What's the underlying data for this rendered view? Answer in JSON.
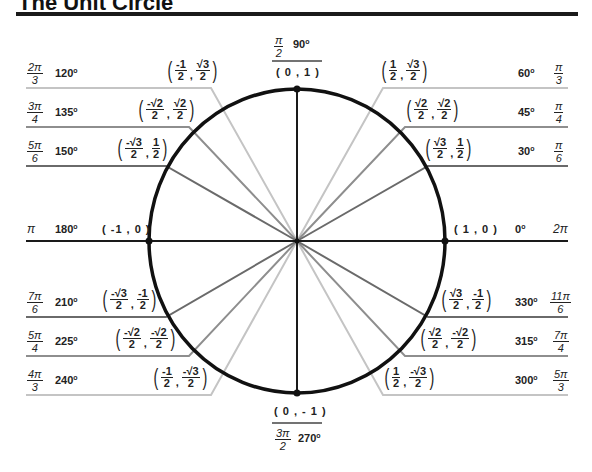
{
  "title": "The Unit Circle",
  "colors": {
    "circle": "#111111",
    "axes": "#1a1a1a",
    "angle30": "#666666",
    "angle45": "#888888",
    "angle60": "#bbbbbb"
  },
  "axes": {
    "top": {
      "rad_num": "π",
      "rad_den": "2",
      "deg": "90",
      "coord": "( 0 , 1 )"
    },
    "bottom": {
      "rad_num": "3π",
      "rad_den": "2",
      "deg": "270",
      "coord": "( 0 , - 1 )"
    },
    "left": {
      "rad": "π",
      "deg": "180",
      "coord": "( -1 , 0 )"
    },
    "right": {
      "rad": "2π",
      "deg": "0",
      "coord": "( 1 , 0 )"
    }
  },
  "angles": [
    {
      "deg": "30",
      "rad_num": "π",
      "rad_den": "6",
      "x_num": "√3",
      "x_den": "2",
      "y_num": "1",
      "y_den": "2"
    },
    {
      "deg": "45",
      "rad_num": "π",
      "rad_den": "4",
      "x_num": "√2",
      "x_den": "2",
      "y_num": "√2",
      "y_den": "2"
    },
    {
      "deg": "60",
      "rad_num": "π",
      "rad_den": "3",
      "x_num": "1",
      "x_den": "2",
      "y_num": "√3",
      "y_den": "2"
    },
    {
      "deg": "120",
      "rad_num": "2π",
      "rad_den": "3",
      "x_num": "-1",
      "x_den": "2",
      "y_num": "√3",
      "y_den": "2"
    },
    {
      "deg": "135",
      "rad_num": "3π",
      "rad_den": "4",
      "x_num": "-√2",
      "x_den": "2",
      "y_num": "√2",
      "y_den": "2"
    },
    {
      "deg": "150",
      "rad_num": "5π",
      "rad_den": "6",
      "x_num": "-√3",
      "x_den": "2",
      "y_num": "1",
      "y_den": "2"
    },
    {
      "deg": "210",
      "rad_num": "7π",
      "rad_den": "6",
      "x_num": "-√3",
      "x_den": "2",
      "y_num": "-1",
      "y_den": "2"
    },
    {
      "deg": "225",
      "rad_num": "5π",
      "rad_den": "4",
      "x_num": "-√2",
      "x_den": "2",
      "y_num": "-√2",
      "y_den": "2"
    },
    {
      "deg": "240",
      "rad_num": "4π",
      "rad_den": "3",
      "x_num": "-1",
      "x_den": "2",
      "y_num": "-√3",
      "y_den": "2"
    },
    {
      "deg": "300",
      "rad_num": "5π",
      "rad_den": "3",
      "x_num": "1",
      "x_den": "2",
      "y_num": "-√3",
      "y_den": "2"
    },
    {
      "deg": "315",
      "rad_num": "7π",
      "rad_den": "4",
      "x_num": "√2",
      "x_den": "2",
      "y_num": "-√2",
      "y_den": "2"
    },
    {
      "deg": "330",
      "rad_num": "11π",
      "rad_den": "6",
      "x_num": "√3",
      "x_den": "2",
      "y_num": "-1",
      "y_den": "2"
    }
  ]
}
